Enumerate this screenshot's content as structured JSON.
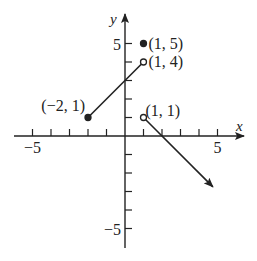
{
  "chart_data": {
    "type": "line",
    "title": "",
    "xlabel": "x",
    "ylabel": "y",
    "xlim": [
      -6,
      6
    ],
    "ylim": [
      -6,
      6
    ],
    "x_ticks": [
      -5,
      -4,
      -3,
      -2,
      -1,
      1,
      2,
      3,
      4,
      5
    ],
    "y_ticks": [
      -5,
      -4,
      -3,
      -2,
      -1,
      1,
      2,
      3,
      4,
      5
    ],
    "x_tick_labels": [
      {
        "value": -5,
        "label": "−5"
      },
      {
        "value": 5,
        "label": "5"
      }
    ],
    "y_tick_labels": [
      {
        "value": 5,
        "label": "5"
      },
      {
        "value": -5,
        "label": "−5"
      }
    ],
    "segments": [
      {
        "name": "segment-left",
        "from": [
          -2,
          1
        ],
        "to": [
          1,
          4
        ],
        "from_closed": true,
        "to_closed": false,
        "arrow": false
      },
      {
        "name": "ray-right",
        "from": [
          1,
          1
        ],
        "to": [
          4.75,
          -2.75
        ],
        "from_closed": false,
        "arrow": true
      }
    ],
    "points": [
      {
        "name": "point-1-5",
        "x": 1,
        "y": 5,
        "filled": true,
        "label": "(1, 5)"
      },
      {
        "name": "point-1-4",
        "x": 1,
        "y": 4,
        "filled": false,
        "label": "(1, 4)"
      },
      {
        "name": "point-neg2-1",
        "x": -2,
        "y": 1,
        "filled": true,
        "label": "(−2, 1)"
      },
      {
        "name": "point-1-1",
        "x": 1,
        "y": 1,
        "filled": false,
        "label": "(1, 1)"
      }
    ]
  }
}
